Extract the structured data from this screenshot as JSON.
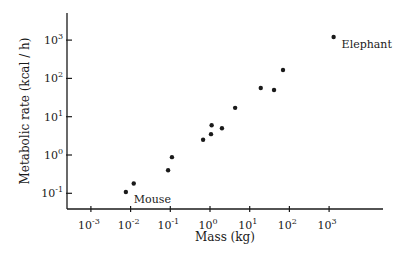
{
  "chart_data": {
    "type": "scatter",
    "title": "",
    "xlabel": "Mass (kg)",
    "ylabel": "Metabolic rate (kcal / h)",
    "xscale": "log",
    "yscale": "log",
    "xlim": [
      0.0003,
      30000
    ],
    "ylim": [
      0.04,
      5000
    ],
    "grid": false,
    "legend": null,
    "x_ticks": [
      {
        "exp": "-3",
        "value": 0.001
      },
      {
        "exp": "-2",
        "value": 0.01
      },
      {
        "exp": "-1",
        "value": 0.1
      },
      {
        "exp": "0",
        "value": 1
      },
      {
        "exp": "1",
        "value": 10
      },
      {
        "exp": "2",
        "value": 100
      },
      {
        "exp": "3",
        "value": 1000
      }
    ],
    "y_ticks": [
      {
        "exp": "-1",
        "value": 0.1
      },
      {
        "exp": "0",
        "value": 1
      },
      {
        "exp": "1",
        "value": 10
      },
      {
        "exp": "2",
        "value": 100
      },
      {
        "exp": "3",
        "value": 1000
      }
    ],
    "points": [
      {
        "x": 0.0076,
        "y": 0.108,
        "label": "Mouse"
      },
      {
        "x": 0.012,
        "y": 0.18
      },
      {
        "x": 0.088,
        "y": 0.4
      },
      {
        "x": 0.11,
        "y": 0.88
      },
      {
        "x": 0.67,
        "y": 2.5
      },
      {
        "x": 1.06,
        "y": 3.5
      },
      {
        "x": 1.1,
        "y": 6.0
      },
      {
        "x": 2.0,
        "y": 5.0
      },
      {
        "x": 4.3,
        "y": 17
      },
      {
        "x": 19,
        "y": 56
      },
      {
        "x": 41,
        "y": 50
      },
      {
        "x": 69,
        "y": 166
      },
      {
        "x": 1300,
        "y": 1200,
        "label": "Elephant"
      }
    ],
    "annotations": [
      {
        "text": "Mouse",
        "near": {
          "x": 0.0076,
          "y": 0.108
        }
      },
      {
        "text": "Elephant",
        "near": {
          "x": 1300,
          "y": 1200
        }
      }
    ]
  },
  "layout": {
    "x_origin_px": 210,
    "x_px_per_decade": 39.7,
    "x_axis_y": 209,
    "x_axis_start": 67,
    "x_axis_end": 383,
    "y_origin_px": 155,
    "y_px_per_decade": 38.3,
    "y_axis_x": 67,
    "y_axis_top": 13,
    "ink_color": "#1a1a1a"
  }
}
